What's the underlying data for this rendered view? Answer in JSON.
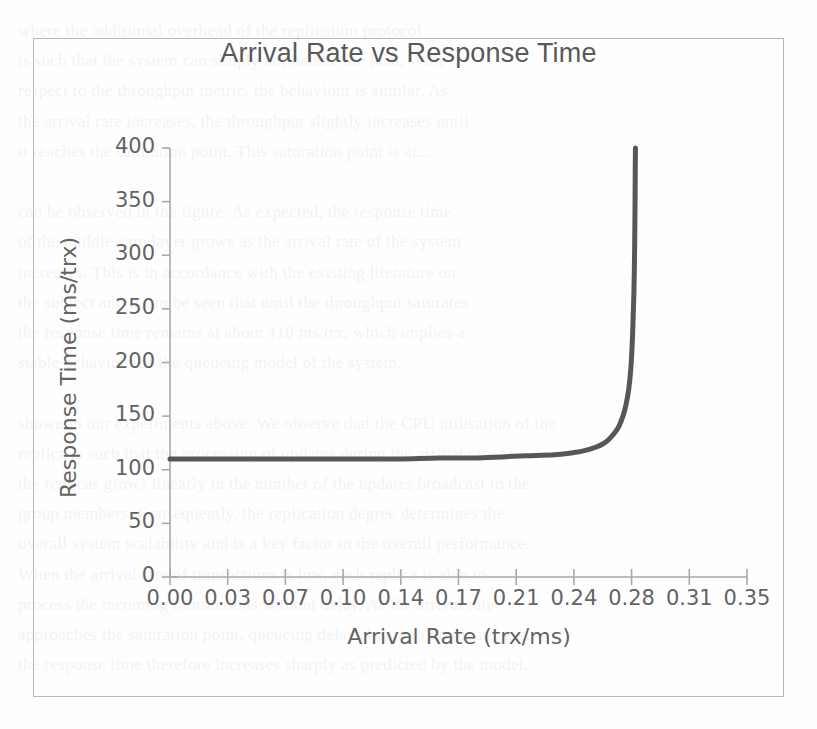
{
  "figure": {
    "title": "Arrival Rate vs Response Time",
    "border_color": "#b9b9b9",
    "background_color": "#ffffff"
  },
  "chart_data": {
    "type": "line",
    "title": "Arrival Rate vs Response Time",
    "xlabel": "Arrival Rate (trx/ms)",
    "ylabel": "Response Time (ms/trx)",
    "xlim": [
      0.0,
      0.35
    ],
    "ylim": [
      0,
      400
    ],
    "grid": false,
    "legend": false,
    "line_color": "#575757",
    "line_width": 5,
    "xticks": [
      0.0,
      0.03,
      0.07,
      0.1,
      0.14,
      0.17,
      0.21,
      0.24,
      0.28,
      0.31,
      0.35
    ],
    "xtick_labels": [
      "0.00",
      "0.03",
      "0.07",
      "0.10",
      "0.14",
      "0.17",
      "0.21",
      "0.24",
      "0.28",
      "0.31",
      "0.35"
    ],
    "yticks": [
      0,
      50,
      100,
      150,
      200,
      250,
      300,
      350,
      400
    ],
    "ytick_labels": [
      "0",
      "50",
      "100",
      "150",
      "200",
      "250",
      "300",
      "350",
      "400"
    ],
    "series": [
      {
        "name": "Response Time",
        "x": [
          0.0,
          0.02,
          0.04,
          0.06,
          0.08,
          0.1,
          0.12,
          0.14,
          0.16,
          0.18,
          0.2,
          0.215,
          0.23,
          0.24,
          0.248,
          0.255,
          0.26,
          0.264,
          0.268,
          0.271,
          0.274,
          0.276,
          0.278,
          0.2795,
          0.2805,
          0.2812,
          0.2816,
          0.2818,
          0.2819,
          0.282
        ],
        "y": [
          110,
          110,
          110,
          110,
          110,
          110,
          110,
          110,
          111,
          111,
          112,
          113,
          114,
          116,
          118,
          121,
          124,
          128,
          134,
          140,
          150,
          160,
          175,
          195,
          225,
          265,
          310,
          350,
          380,
          400
        ]
      }
    ],
    "annotations": [
      "Response time remains flat near 110 ms/trx until roughly 0.25 trx/ms, then rises asymptotically toward a vertical limit near 0.28 trx/ms."
    ]
  },
  "ghost_text": {
    "lines": [
      "where the additional overhead of the replication protocol",
      "is such that the system can simply not handle the load. With",
      "respect to the throughput metric, the behaviour is similar. As",
      "the arrival rate increases, the throughput slightly increases until",
      "it reaches the saturation point. This saturation point is at...",
      "",
      "can be observed in the figure. As expected, the response time",
      "of the middleware layer grows as the arrival rate of the system",
      "increases. This is in accordance with the existing literature on",
      "the subject and it can be seen that until the throughput saturates",
      "the response time remains at about 110 ms/trx, which implies a",
      "stable behaviour of the queueing model of the system.",
      "",
      "shown in our experiments above. We observe that the CPU utilisation of the",
      "replica is such that the processing of updates during the arrival rate of",
      "the replicas grows linearly in the number of the updates broadcast to the",
      "group members. Consequently, the replication degree determines the",
      "overall system scalability and is a key factor in the overall performance.",
      "When the arrival rate of transactions is low, each replica is able to",
      "process the incoming transactions without delay. As the arrival rate",
      "approaches the saturation point, queueing delays begin to dominate, and",
      "the response time therefore increases sharply as predicted by the model."
    ]
  }
}
